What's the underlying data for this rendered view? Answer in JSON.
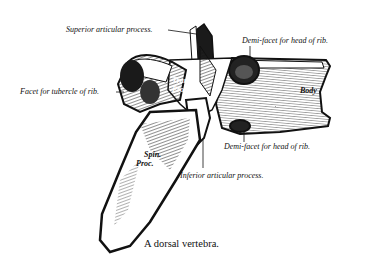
{
  "figure": {
    "caption": "A dorsal vertebra.",
    "labels": {
      "superior_articular": "Superior articular process.",
      "demi_facet_upper": "Demi-facet for head of rib.",
      "facet_tubercle": "Facet for tubercle of rib.",
      "demi_facet_lower": "Demi-facet for head of rib.",
      "inferior_articular": "Inferior articular process."
    },
    "inner_labels": {
      "trans_1": "Trans.",
      "trans_2": "Proc.",
      "body": "Body",
      "spin_1": "Spin.",
      "spin_2": "Proc."
    },
    "colors": {
      "ink": "#111111",
      "paper": "#ffffff"
    }
  }
}
